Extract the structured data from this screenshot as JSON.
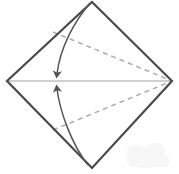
{
  "figure": {
    "canvas": {
      "width": 179,
      "height": 174,
      "background": "#ffffff"
    }
  },
  "colors": {
    "outline": "#4a4a4a",
    "center_crease": "#d0d0d0",
    "dashed_fold": "#b0b0b0",
    "arrow": "#555555",
    "watermark": "#f2f2f2",
    "background": "#ffffff"
  },
  "geometry": {
    "diamond": {
      "label": "paper-outline",
      "top": {
        "x": 92,
        "y": 2
      },
      "right": {
        "x": 172,
        "y": 81
      },
      "bottom": {
        "x": 92,
        "y": 168
      },
      "left": {
        "x": 7,
        "y": 81
      },
      "stroke_width": 2.2
    },
    "center_crease": {
      "label": "horizontal-center-crease",
      "from": {
        "x": 7,
        "y": 81
      },
      "to": {
        "x": 172,
        "y": 81
      },
      "stroke_width": 2.0
    },
    "dashed_upper": {
      "label": "upper-fold-line",
      "from": {
        "x": 53,
        "y": 32
      },
      "to": {
        "x": 172,
        "y": 81
      },
      "dash": "5 4",
      "stroke_width": 1.6
    },
    "dashed_lower": {
      "label": "lower-fold-line",
      "from": {
        "x": 53,
        "y": 130
      },
      "to": {
        "x": 172,
        "y": 81
      },
      "dash": "5 4",
      "stroke_width": 1.6
    },
    "arrow_upper": {
      "label": "upper-fold-arrow",
      "path": "M 90 3 C 74 22, 60 48, 57 76",
      "tip": {
        "x": 57,
        "y": 79
      },
      "stroke_width": 1.5
    },
    "arrow_lower": {
      "label": "lower-fold-arrow",
      "path": "M 88 165 C 72 145, 60 112, 57 87",
      "tip": {
        "x": 57,
        "y": 84
      },
      "stroke_width": 1.5
    },
    "watermark": {
      "label": "corner-watermark",
      "x": 128,
      "y": 142,
      "width": 48,
      "height": 30
    }
  },
  "labels": {
    "figure_caption": "",
    "step_number": "",
    "alt_text": "Diamond shaped paper with two flaps folded to the center line"
  }
}
